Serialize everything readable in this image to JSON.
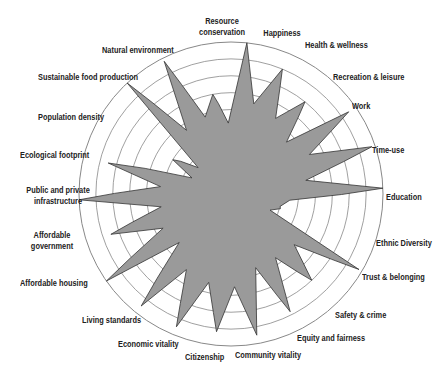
{
  "chart_data": {
    "type": "radar",
    "title": "",
    "center": [
      231,
      194
    ],
    "outer_radius": 152,
    "rings": 9,
    "range": [
      0,
      9
    ],
    "grid": true,
    "fill_color": "#9a9a9a",
    "stroke_color": "#333333",
    "grid_color": "#888888",
    "categories": [
      "Happiness",
      "Health & wellness",
      "Recreation & leisure",
      "Work",
      "Time-use",
      "Education",
      "Ethnic Diversity",
      "Trust & belonging",
      "Safety & crime",
      "Equity and fairness",
      "Community vitality",
      "Citizenship",
      "Economic vitality",
      "Living standards",
      "Affordable housing",
      "Affordable government",
      "Public and private infrastructure",
      "Ecological footprint",
      "Population density",
      "Sustainable food production",
      "Natural environment",
      "Resource conservation"
    ],
    "values": [
      9,
      8,
      7,
      8.5,
      8.8,
      9,
      3,
      8.8,
      7,
      7.8,
      8.5,
      8.2,
      8.5,
      8.5,
      9,
      7.5,
      9,
      7.5,
      4,
      9,
      8.8,
      6
    ],
    "valleys": [
      5.5,
      5.2,
      4.5,
      5.2,
      4.5,
      3.5,
      2.5,
      4.8,
      4.6,
      4.6,
      5.5,
      5.4,
      5.2,
      4.2,
      4.5,
      4.2,
      4.2,
      2.5,
      2.5,
      4.6,
      4.8,
      4.2
    ]
  },
  "labels": [
    {
      "text": "Resource",
      "text2": "conservation",
      "x": 192,
      "y": 16,
      "align": "c",
      "w": 60
    },
    {
      "text": "Happiness",
      "x": 252,
      "y": 28,
      "align": "c",
      "w": 60
    },
    {
      "text": "Health & wellness",
      "x": 305,
      "y": 40,
      "align": "l",
      "w": 80
    },
    {
      "text": "Recreation & leisure",
      "x": 333,
      "y": 72,
      "align": "l",
      "w": 100
    },
    {
      "text": "Work",
      "x": 352,
      "y": 101,
      "align": "l",
      "w": 40
    },
    {
      "text": "Time-use",
      "x": 372,
      "y": 145,
      "align": "l",
      "w": 60
    },
    {
      "text": "Education",
      "x": 386,
      "y": 192,
      "align": "l",
      "w": 60
    },
    {
      "text": "Ethnic Diversity",
      "x": 376,
      "y": 238,
      "align": "l",
      "w": 70
    },
    {
      "text": "Trust & belonging",
      "x": 362,
      "y": 272,
      "align": "l",
      "w": 80
    },
    {
      "text": "Safety & crime",
      "x": 335,
      "y": 310,
      "align": "l",
      "w": 70
    },
    {
      "text": "Equity and fairness",
      "x": 297,
      "y": 333,
      "align": "l",
      "w": 90
    },
    {
      "text": "Community vitality",
      "x": 235,
      "y": 350,
      "align": "l",
      "w": 90
    },
    {
      "text": "Citizenship",
      "x": 185,
      "y": 352,
      "align": "l",
      "w": 60
    },
    {
      "text": "Economic vitality",
      "x": 118,
      "y": 339,
      "align": "l",
      "w": 80
    },
    {
      "text": "Living standards",
      "x": 82,
      "y": 315,
      "align": "l",
      "w": 80
    },
    {
      "text": "Affordable housing",
      "x": 20,
      "y": 278,
      "align": "l",
      "w": 90
    },
    {
      "text": "Affordable",
      "text2": "government",
      "x": 22,
      "y": 230,
      "align": "c",
      "w": 60
    },
    {
      "text": "Public and private",
      "text2": "infrastructure",
      "x": 18,
      "y": 185,
      "align": "c",
      "w": 80
    },
    {
      "text": "Ecological footprint",
      "x": 20,
      "y": 150,
      "align": "l",
      "w": 90
    },
    {
      "text": "Population density",
      "x": 38,
      "y": 112,
      "align": "l",
      "w": 90
    },
    {
      "text": "Sustainable food production",
      "x": 38,
      "y": 72,
      "align": "l",
      "w": 130
    },
    {
      "text": "Natural environment",
      "x": 102,
      "y": 45,
      "align": "l",
      "w": 100
    }
  ]
}
